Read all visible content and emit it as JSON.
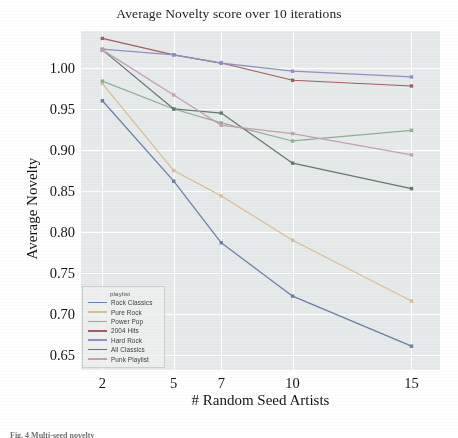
{
  "chart_data": {
    "type": "line",
    "title": "Average Novelty score over 10 iterations",
    "xlabel": "# Random Seed Artists",
    "ylabel": "Average Novelty",
    "x": [
      2,
      5,
      7,
      10,
      15
    ],
    "xtick_labels": [
      "2",
      "5",
      "7",
      "10",
      "15"
    ],
    "ytick_labels": [
      "0.65",
      "0.70",
      "0.75",
      "0.80",
      "0.85",
      "0.90",
      "0.95",
      "1.00"
    ],
    "yticks": [
      0.65,
      0.7,
      0.75,
      0.8,
      0.85,
      0.9,
      0.95,
      1.0
    ],
    "ylim": [
      0.632,
      1.045
    ],
    "xlim": [
      1.1,
      16.2
    ],
    "grid": true,
    "legend_position": "lower left",
    "legend_title": "playlist",
    "series": [
      {
        "name": "Rock Classics",
        "color": "#6a7fa8",
        "values": [
          0.96,
          0.862,
          0.787,
          0.722,
          0.661
        ]
      },
      {
        "name": "Pure Rock",
        "color": "#d8bf94",
        "values": [
          0.981,
          0.875,
          0.844,
          0.79,
          0.716
        ]
      },
      {
        "name": "Power Pop",
        "color": "#8fae96",
        "values": [
          0.984,
          0.95,
          0.933,
          0.911,
          0.924
        ]
      },
      {
        "name": "2004 Hits",
        "color": "#a35c63",
        "values": [
          1.036,
          1.016,
          1.006,
          0.985,
          0.978
        ]
      },
      {
        "name": "Hard Rock",
        "color": "#8d90c4",
        "values": [
          1.023,
          1.016,
          1.006,
          0.996,
          0.989
        ]
      },
      {
        "name": "All Classics",
        "color": "#66786e",
        "values": [
          1.022,
          0.95,
          0.945,
          0.884,
          0.853
        ]
      },
      {
        "name": "Punk Playlist",
        "color": "#c3a0b4",
        "values": [
          1.022,
          0.967,
          0.93,
          0.92,
          0.894
        ]
      }
    ]
  },
  "caption": {
    "text": "Fig. 4  Multi-seed novelty"
  }
}
